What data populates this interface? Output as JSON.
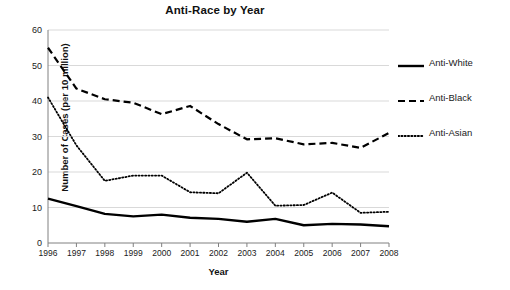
{
  "chart_data": {
    "type": "line",
    "title": "Anti-Race by Year",
    "xlabel": "Year",
    "ylabel": "Number of Cases (per 10 million)",
    "x": [
      1996,
      1997,
      1998,
      1999,
      2000,
      2001,
      2002,
      2003,
      2004,
      2005,
      2006,
      2007,
      2008
    ],
    "categories": [
      "1996",
      "1997",
      "1998",
      "1999",
      "2000",
      "2001",
      "2002",
      "2003",
      "2004",
      "2005",
      "2006",
      "2007",
      "2008"
    ],
    "xlim": [
      1996,
      2008
    ],
    "ylim": [
      0,
      60
    ],
    "yticks": [
      0,
      10,
      20,
      30,
      40,
      50,
      60
    ],
    "ytick_labels": [
      "0",
      "10",
      "20",
      "30",
      "40",
      "50",
      "60"
    ],
    "grid": "horizontal",
    "legend_position": "right",
    "series": [
      {
        "name": "Anti-White",
        "style": "solid",
        "color": "#000000",
        "values": [
          12.5,
          10.4,
          8.2,
          7.5,
          8.0,
          7.1,
          6.8,
          6.0,
          6.8,
          5.0,
          5.4,
          5.2,
          4.7
        ]
      },
      {
        "name": "Anti-Black",
        "style": "dashed",
        "color": "#000000",
        "values": [
          55.0,
          43.5,
          40.5,
          39.5,
          36.3,
          38.6,
          33.5,
          29.2,
          29.5,
          27.8,
          28.2,
          26.8,
          31.0
        ]
      },
      {
        "name": "Anti-Asian",
        "style": "dotted",
        "color": "#000000",
        "values": [
          41.0,
          27.5,
          17.5,
          19.0,
          19.0,
          14.3,
          14.0,
          19.8,
          10.5,
          10.7,
          14.2,
          8.5,
          8.8
        ]
      }
    ]
  },
  "legend": {
    "items": [
      {
        "label": "Anti-White",
        "icon": "solid-line-icon"
      },
      {
        "label": "Anti-Black",
        "icon": "dashed-line-icon"
      },
      {
        "label": "Anti-Asian",
        "icon": "dotted-line-icon"
      }
    ]
  },
  "colors": {
    "series": "#000000",
    "grid": "#d9d9d9",
    "axis": "#808080",
    "text": "#1a1a1a",
    "background": "#ffffff"
  }
}
